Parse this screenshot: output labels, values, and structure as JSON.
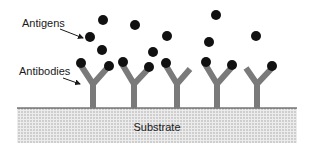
{
  "diagram": {
    "labels": {
      "antigens": "Antigens",
      "antibodies": "Antibodies",
      "substrate": "Substrate"
    },
    "colors": {
      "antigen": "#111111",
      "antibody": "#7a7a7a",
      "substrate_line": "#333333",
      "substrate_fill": "#e6e6e6",
      "substrate_dots": "#9a9a9a",
      "text": "#1a1a1a"
    },
    "antibody_count": 5,
    "free_antigen_count": 9,
    "bound_antigen_count": 8
  }
}
